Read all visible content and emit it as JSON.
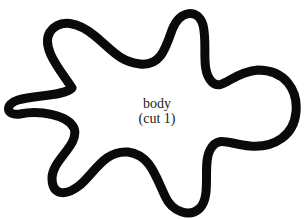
{
  "diagram": {
    "shape": {
      "type": "closed-outline-blob",
      "stroke_color": "#0a0a0a",
      "fill_color": "#ffffff",
      "stroke_width": 9
    },
    "label": {
      "line1": "body",
      "line2": "(cut 1)"
    }
  }
}
